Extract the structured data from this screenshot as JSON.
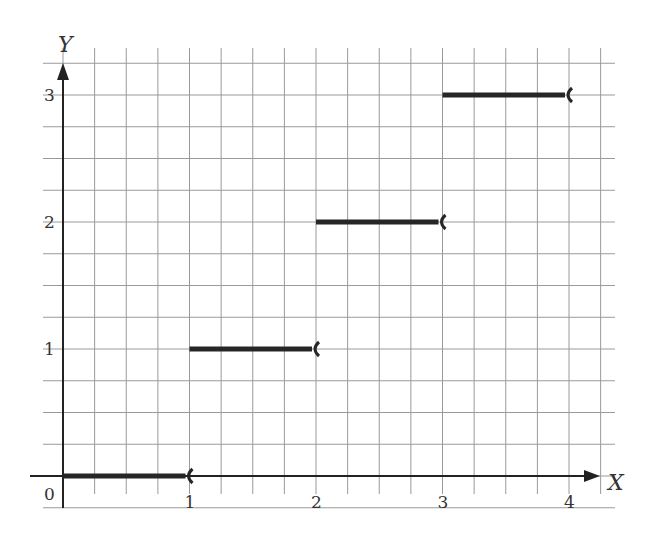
{
  "chart_data": {
    "type": "line",
    "subtype": "step",
    "title": "",
    "xlabel": "X",
    "ylabel": "Y",
    "origin_label": "0",
    "xlim": [
      0,
      4.2
    ],
    "ylim": [
      0,
      3.3
    ],
    "x_ticks": [
      1,
      2,
      3,
      4
    ],
    "x_tick_labels": [
      "1",
      "2",
      "3",
      "4"
    ],
    "y_ticks": [
      1,
      2,
      3
    ],
    "y_tick_labels": [
      "1",
      "2",
      "3"
    ],
    "grid": true,
    "grid_minor_step": 0.25,
    "legend": null,
    "series": [
      {
        "name": "step function",
        "segments": [
          {
            "x_start": 0,
            "x_end": 1,
            "y": 0,
            "left_closed": true,
            "right_open": true
          },
          {
            "x_start": 1,
            "x_end": 2,
            "y": 1,
            "left_closed": true,
            "right_open": true
          },
          {
            "x_start": 2,
            "x_end": 3,
            "y": 2,
            "left_closed": true,
            "right_open": true
          },
          {
            "x_start": 3,
            "x_end": 4,
            "y": 3,
            "left_closed": true,
            "right_open": true
          }
        ]
      }
    ]
  },
  "layout": {
    "origin_px": [
      63,
      476
    ],
    "x_unit_px": 126.5,
    "y_unit_px": 127,
    "grid_left": 43,
    "grid_right": 615,
    "grid_top": 48,
    "grid_bottom": 508,
    "colors": {
      "grid": "#9a9a9a",
      "axis": "#222222",
      "segment": "#262626",
      "text": "#333333"
    }
  }
}
